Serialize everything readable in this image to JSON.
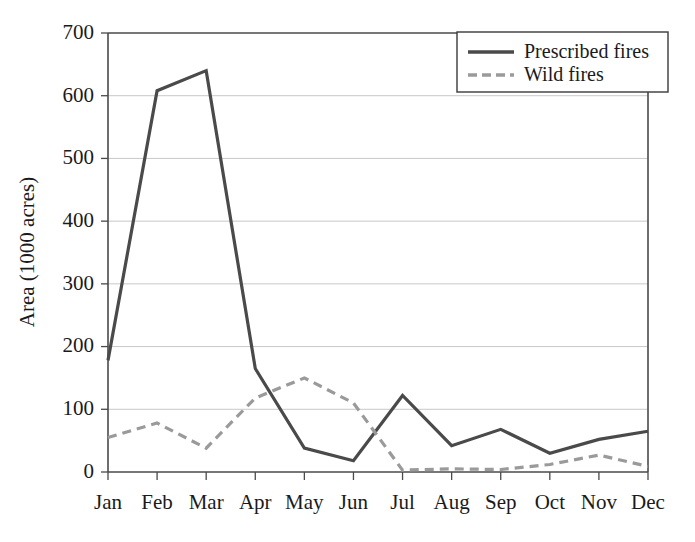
{
  "chart_data": {
    "type": "line",
    "title": "",
    "subtitle": "",
    "xlabel": "",
    "ylabel": "Area (1000 acres)",
    "categories": [
      "Jan",
      "Feb",
      "Mar",
      "Apr",
      "May",
      "Jun",
      "Jul",
      "Aug",
      "Sep",
      "Oct",
      "Nov",
      "Dec"
    ],
    "x_tick_labels": [
      "Jan",
      "Feb",
      "Mar",
      "Apr",
      "May",
      "Jun",
      "Jul",
      "Aug",
      "Sep",
      "Oct",
      "Nov",
      "Dec"
    ],
    "y_tick_labels": [
      "0",
      "100",
      "200",
      "300",
      "400",
      "500",
      "600",
      "700"
    ],
    "y_ticks": [
      0,
      100,
      200,
      300,
      400,
      500,
      600,
      700
    ],
    "ylim": [
      0,
      700
    ],
    "grid": "horizontal",
    "legend_position": "top-right",
    "series": [
      {
        "name": "Prescribed fires",
        "style": "solid",
        "color": "#4a4a4a",
        "values": [
          178,
          608,
          640,
          165,
          38,
          18,
          122,
          42,
          68,
          30,
          52,
          65
        ]
      },
      {
        "name": "Wild fires",
        "style": "dashed",
        "color": "#9a9a9a",
        "values": [
          55,
          78,
          38,
          118,
          150,
          110,
          3,
          5,
          4,
          12,
          27,
          9
        ]
      }
    ]
  },
  "legend": {
    "entries": [
      {
        "label": "Prescribed fires"
      },
      {
        "label": "Wild fires"
      }
    ]
  },
  "colors": {
    "prescribed_line": "#4a4a4a",
    "wild_line": "#9a9a9a",
    "gridline": "#c8c8c8",
    "axis": "#4a4a4a",
    "text": "#1a1a1a",
    "background": "#ffffff"
  }
}
